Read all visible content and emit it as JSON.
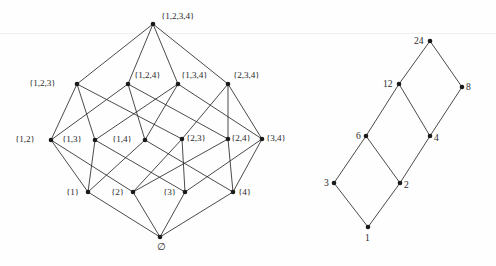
{
  "figure": {
    "background_color": "#fefefe",
    "line_color": "#2b2b2b",
    "node_color": "#1a1a1a"
  },
  "diagrams": [
    {
      "id": "subset-lattice",
      "name": "Boolean lattice of subsets of {1,2,3,4}",
      "nodes": [
        {
          "id": "full",
          "label": "{1,2,3,4}",
          "x": 153,
          "y": 24,
          "label_dx": 8,
          "label_dy": -12,
          "label_align": "left"
        },
        {
          "id": "123",
          "label": "{1,2,3}",
          "x": 77,
          "y": 84,
          "label_dx": -48,
          "label_dy": -5,
          "label_align": "left"
        },
        {
          "id": "124",
          "label": "{1,2,4}",
          "x": 128,
          "y": 84,
          "label_dx": 6,
          "label_dy": -13,
          "label_align": "left"
        },
        {
          "id": "134",
          "label": "{1,3,4}",
          "x": 178,
          "y": 84,
          "label_dx": 3,
          "label_dy": -13,
          "label_align": "left"
        },
        {
          "id": "234",
          "label": "{2,3,4}",
          "x": 228,
          "y": 84,
          "label_dx": 5,
          "label_dy": -13,
          "label_align": "left"
        },
        {
          "id": "12",
          "label": "{1,2}",
          "x": 51,
          "y": 140,
          "label_dx": -36,
          "label_dy": -5,
          "label_align": "left"
        },
        {
          "id": "13",
          "label": "{1,3}",
          "x": 95,
          "y": 140,
          "label_dx": -33,
          "label_dy": -5,
          "label_align": "left"
        },
        {
          "id": "14",
          "label": "{1,4}",
          "x": 145,
          "y": 140,
          "label_dx": -33,
          "label_dy": -5,
          "label_align": "left"
        },
        {
          "id": "23",
          "label": "{2,3}",
          "x": 182,
          "y": 139,
          "label_dx": 4,
          "label_dy": -5,
          "label_align": "left"
        },
        {
          "id": "24",
          "label": "{2,4}",
          "x": 228,
          "y": 139,
          "label_dx": 3,
          "label_dy": -5,
          "label_align": "left"
        },
        {
          "id": "34",
          "label": "{3,4}",
          "x": 262,
          "y": 139,
          "label_dx": 4,
          "label_dy": -5,
          "label_align": "left"
        },
        {
          "id": "1",
          "label": "{1}",
          "x": 88,
          "y": 192,
          "label_dx": -22,
          "label_dy": -4,
          "label_align": "left"
        },
        {
          "id": "2",
          "label": "{2}",
          "x": 133,
          "y": 192,
          "label_dx": -22,
          "label_dy": -4,
          "label_align": "left"
        },
        {
          "id": "3",
          "label": "{3}",
          "x": 185,
          "y": 192,
          "label_dx": -22,
          "label_dy": -4,
          "label_align": "left"
        },
        {
          "id": "4",
          "label": "{4}",
          "x": 233,
          "y": 192,
          "label_dx": 5,
          "label_dy": -4,
          "label_align": "left"
        },
        {
          "id": "empty",
          "label": "∅",
          "x": 160,
          "y": 237,
          "label_dx": -3,
          "label_dy": 5,
          "label_align": "left"
        }
      ],
      "edges": [
        [
          "full",
          "123"
        ],
        [
          "full",
          "124"
        ],
        [
          "full",
          "134"
        ],
        [
          "full",
          "234"
        ],
        [
          "123",
          "12"
        ],
        [
          "123",
          "13"
        ],
        [
          "123",
          "23"
        ],
        [
          "124",
          "12"
        ],
        [
          "124",
          "14"
        ],
        [
          "124",
          "24"
        ],
        [
          "134",
          "13"
        ],
        [
          "134",
          "14"
        ],
        [
          "134",
          "34"
        ],
        [
          "234",
          "23"
        ],
        [
          "234",
          "24"
        ],
        [
          "234",
          "34"
        ],
        [
          "12",
          "1"
        ],
        [
          "12",
          "2"
        ],
        [
          "13",
          "1"
        ],
        [
          "13",
          "3"
        ],
        [
          "14",
          "1"
        ],
        [
          "14",
          "4"
        ],
        [
          "23",
          "2"
        ],
        [
          "23",
          "3"
        ],
        [
          "24",
          "2"
        ],
        [
          "24",
          "4"
        ],
        [
          "34",
          "3"
        ],
        [
          "34",
          "4"
        ],
        [
          "1",
          "empty"
        ],
        [
          "2",
          "empty"
        ],
        [
          "3",
          "empty"
        ],
        [
          "4",
          "empty"
        ]
      ]
    },
    {
      "id": "divisor-lattice-24",
      "name": "Divisor lattice of 24",
      "nodes": [
        {
          "id": "d24",
          "label": "24",
          "x": 430,
          "y": 41,
          "label_dx": -16,
          "label_dy": -5,
          "label_align": "left"
        },
        {
          "id": "d12",
          "label": "12",
          "x": 399,
          "y": 84,
          "label_dx": -16,
          "label_dy": -5,
          "label_align": "left"
        },
        {
          "id": "d8",
          "label": "8",
          "x": 462,
          "y": 87,
          "label_dx": 4,
          "label_dy": -5,
          "label_align": "left"
        },
        {
          "id": "d6",
          "label": "6",
          "x": 366,
          "y": 136,
          "label_dx": -10,
          "label_dy": -5,
          "label_align": "left"
        },
        {
          "id": "d4",
          "label": "4",
          "x": 430,
          "y": 136,
          "label_dx": 4,
          "label_dy": -3,
          "label_align": "left"
        },
        {
          "id": "d3",
          "label": "3",
          "x": 334,
          "y": 183,
          "label_dx": -10,
          "label_dy": -5,
          "label_align": "left"
        },
        {
          "id": "d2",
          "label": "2",
          "x": 400,
          "y": 183,
          "label_dx": 4,
          "label_dy": -3,
          "label_align": "left"
        },
        {
          "id": "d1",
          "label": "1",
          "x": 368,
          "y": 227,
          "label_dx": -3,
          "label_dy": 6,
          "label_align": "left"
        }
      ],
      "edges": [
        [
          "d24",
          "d12"
        ],
        [
          "d24",
          "d8"
        ],
        [
          "d12",
          "d6"
        ],
        [
          "d12",
          "d4"
        ],
        [
          "d8",
          "d4"
        ],
        [
          "d6",
          "d3"
        ],
        [
          "d6",
          "d2"
        ],
        [
          "d4",
          "d2"
        ],
        [
          "d3",
          "d1"
        ],
        [
          "d2",
          "d1"
        ]
      ]
    }
  ],
  "artifacts": {
    "scan_line_y": 33
  }
}
